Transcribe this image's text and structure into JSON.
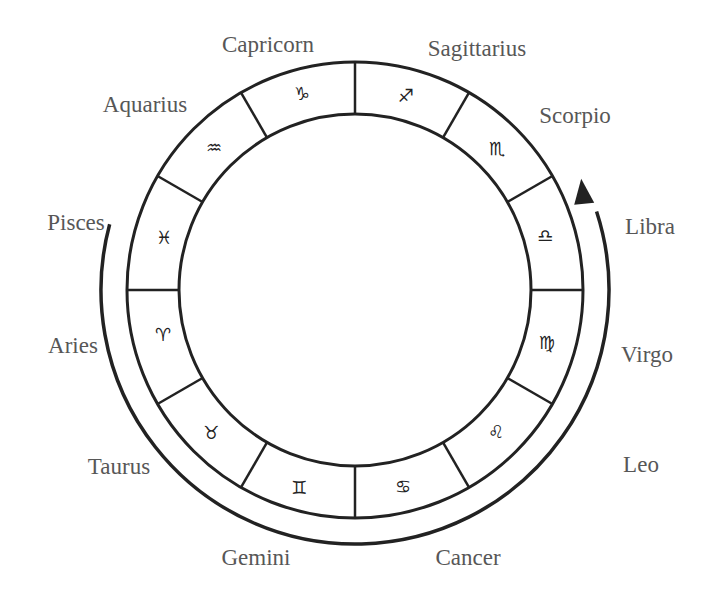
{
  "diagram": {
    "center": [
      355,
      290
    ],
    "outer_radius": 228,
    "inner_radius": 176,
    "arrow_radius": 254,
    "colors": {
      "line": "#222222",
      "label": "#575757",
      "background": "#ffffff"
    },
    "signs": [
      {
        "name": "Capricorn",
        "symbol": "♑",
        "label_pos": [
          268,
          44
        ],
        "symbol_pos": [
          302,
          94
        ]
      },
      {
        "name": "Sagittarius",
        "symbol": "♐",
        "label_pos": [
          477,
          48
        ],
        "symbol_pos": [
          406,
          96
        ]
      },
      {
        "name": "Scorpio",
        "symbol": "♏",
        "label_pos": [
          575,
          115
        ],
        "symbol_pos": [
          497,
          149
        ]
      },
      {
        "name": "Libra",
        "symbol": "♎",
        "label_pos": [
          650,
          226
        ],
        "symbol_pos": [
          545,
          236
        ]
      },
      {
        "name": "Virgo",
        "symbol": "♍",
        "label_pos": [
          647,
          354
        ],
        "symbol_pos": [
          547,
          343
        ]
      },
      {
        "name": "Leo",
        "symbol": "♌",
        "label_pos": [
          641,
          464
        ],
        "symbol_pos": [
          496,
          432
        ]
      },
      {
        "name": "Cancer",
        "symbol": "♋",
        "label_pos": [
          468,
          557
        ],
        "symbol_pos": [
          403,
          487
        ]
      },
      {
        "name": "Gemini",
        "symbol": "♊",
        "label_pos": [
          256,
          557
        ],
        "symbol_pos": [
          299,
          488
        ]
      },
      {
        "name": "Taurus",
        "symbol": "♉",
        "label_pos": [
          119,
          466
        ],
        "symbol_pos": [
          211,
          433
        ]
      },
      {
        "name": "Aries",
        "symbol": "♈",
        "label_pos": [
          73,
          345
        ],
        "symbol_pos": [
          163,
          335
        ]
      },
      {
        "name": "Pisces",
        "symbol": "♓",
        "label_pos": [
          76,
          222
        ],
        "symbol_pos": [
          164,
          238
        ]
      },
      {
        "name": "Aquarius",
        "symbol": "♒",
        "label_pos": [
          145,
          104
        ],
        "symbol_pos": [
          214,
          148
        ]
      }
    ],
    "arrow": {
      "description": "Counter-clockwise-from-viewer arc running from Aries around the bottom to Libra, arrowhead pointing up at Libra",
      "start": "Aries",
      "end": "Libra"
    }
  }
}
